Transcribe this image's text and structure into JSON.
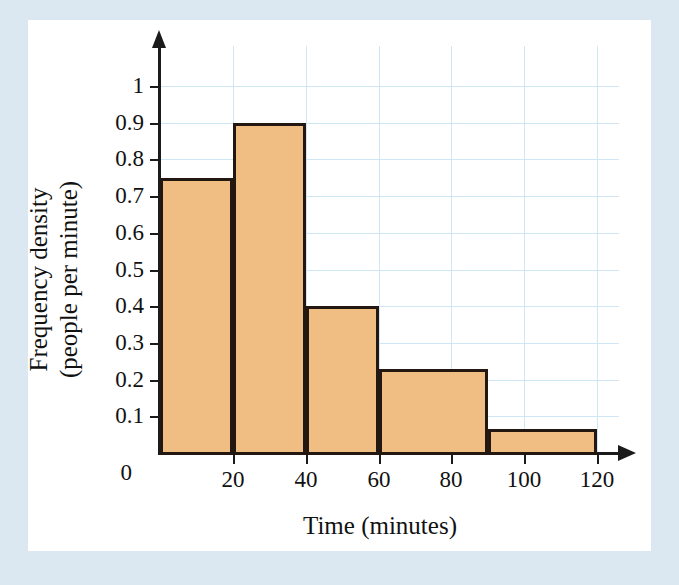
{
  "figure": {
    "background_color": "#dbe8f2",
    "panel_color": "#ffffff",
    "bar_fill_color": "#f0bd82",
    "bar_edge_color": "#231711",
    "grid_color": "#cfe6f4",
    "axis_color": "#1b1b1b"
  },
  "chart_data": {
    "type": "bar",
    "title": "",
    "subtitle": "",
    "xlabel": "Time (minutes)",
    "ylabel": "Frequency density (people per minute)",
    "ylabel_lines": [
      "Frequency density",
      "(people per minute)"
    ],
    "xlim": [
      0,
      120
    ],
    "ylim": [
      0,
      1
    ],
    "grid": true,
    "grid_orientation": "both",
    "legend": null,
    "legend_position": "none",
    "x_ticks": [
      0,
      20,
      40,
      60,
      80,
      100,
      120
    ],
    "x_tick_labels": [
      "0",
      "20",
      "40",
      "60",
      "80",
      "100",
      "120"
    ],
    "y_ticks": [
      0,
      0.1,
      0.2,
      0.3,
      0.4,
      0.5,
      0.6,
      0.7,
      0.8,
      0.9,
      1
    ],
    "y_tick_labels": [
      "0",
      "0.1",
      "0.2",
      "0.3",
      "0.4",
      "0.5",
      "0.6",
      "0.7",
      "0.8",
      "0.9",
      "1"
    ],
    "bins": [
      {
        "label": "0-20",
        "x_start": 0,
        "x_end": 20,
        "value": 0.75,
        "frequency": 15
      },
      {
        "label": "20-40",
        "x_start": 20,
        "x_end": 40,
        "value": 0.9,
        "frequency": 18
      },
      {
        "label": "40-60",
        "x_start": 40,
        "x_end": 60,
        "value": 0.4,
        "frequency": 8
      },
      {
        "label": "60-90",
        "x_start": 60,
        "x_end": 90,
        "value": 0.23,
        "frequency": 7
      },
      {
        "label": "90-120",
        "x_start": 90,
        "x_end": 120,
        "value": 0.065,
        "frequency": 2
      }
    ],
    "categories": [
      "0-20",
      "20-40",
      "40-60",
      "60-90",
      "90-120"
    ],
    "values": [
      0.75,
      0.9,
      0.4,
      0.23,
      0.065
    ],
    "annotations": []
  }
}
